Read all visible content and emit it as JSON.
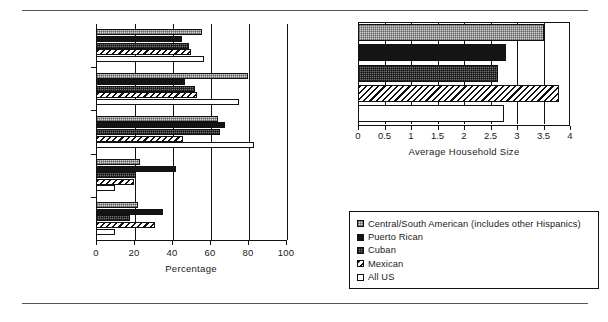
{
  "chart_data": [
    {
      "type": "bar",
      "orientation": "horizontal",
      "title": "",
      "xlabel": "Percentage",
      "ylabel": "",
      "xlim": [
        0,
        100
      ],
      "xticks": [
        0,
        20,
        40,
        60,
        80,
        100
      ],
      "xticklabels": [
        "0",
        "20",
        "40",
        "60",
        "80",
        "100"
      ],
      "grid": true,
      "legend_position": "below-right",
      "categories": [
        "Female Labor\nForce",
        "Male Labor Force",
        "High School\nGraduate",
        "Female Head of\nHousehold",
        "Family Poverty"
      ],
      "series": [
        {
          "name": "Central/South American (includes other Hispanics)",
          "values": [
            56,
            80,
            64,
            23,
            22
          ]
        },
        {
          "name": "Puerto Rican",
          "values": [
            45,
            47,
            68,
            42,
            35
          ]
        },
        {
          "name": "Cuban",
          "values": [
            49,
            52,
            65,
            21,
            18
          ]
        },
        {
          "name": "Mexican",
          "values": [
            50,
            53,
            46,
            20,
            31
          ]
        },
        {
          "name": "All US",
          "values": [
            57,
            75,
            83,
            10,
            10
          ]
        }
      ]
    },
    {
      "type": "bar",
      "orientation": "horizontal",
      "title": "",
      "xlabel": "Average Household Size",
      "ylabel": "",
      "xlim": [
        0,
        4
      ],
      "xticks": [
        0,
        0.5,
        1,
        1.5,
        2,
        2.5,
        3,
        3.5,
        4
      ],
      "xticklabels": [
        "0",
        "0.5",
        "1",
        "1.5",
        "2",
        "2.5",
        "3",
        "3.5",
        "4"
      ],
      "grid": true,
      "categories": [
        "Overall"
      ],
      "series": [
        {
          "name": "Central/South American (includes other Hispanics)",
          "values": [
            3.5
          ]
        },
        {
          "name": "Puerto Rican",
          "values": [
            2.8
          ]
        },
        {
          "name": "Cuban",
          "values": [
            2.65
          ]
        },
        {
          "name": "Mexican",
          "values": [
            3.8
          ]
        },
        {
          "name": "All US",
          "values": [
            2.75
          ]
        }
      ]
    }
  ],
  "left_chart": {
    "xlabel": "Percentage",
    "xticklabels": [
      "0",
      "20",
      "40",
      "60",
      "80",
      "100"
    ],
    "categories": [
      {
        "line1": "Female Labor",
        "line2": "Force"
      },
      {
        "line1": "Male Labor Force",
        "line2": ""
      },
      {
        "line1": "High School",
        "line2": "Graduate"
      },
      {
        "line1": "Female Head of",
        "line2": "Household"
      },
      {
        "line1": "Family Poverty",
        "line2": ""
      }
    ]
  },
  "right_chart": {
    "xlabel": "Average Household Size",
    "xticklabels": [
      "0",
      "0.5",
      "1",
      "1.5",
      "2",
      "2.5",
      "3",
      "3.5",
      "4"
    ]
  },
  "legend": {
    "items": [
      {
        "label": "Central/South American (includes other Hispanics)",
        "pattern": "checker-light"
      },
      {
        "label": "Puerto Rican",
        "pattern": "solid-black"
      },
      {
        "label": "Cuban",
        "pattern": "checker-dark"
      },
      {
        "label": "Mexican",
        "pattern": "diagonal-hatch"
      },
      {
        "label": "All US",
        "pattern": "white"
      }
    ]
  },
  "colors": {
    "central_south_american": "#d2d2d2",
    "puerto_rican": "#141414",
    "cuban": "#6f6f6f",
    "mexican": "#ffffff",
    "all_us": "#ffffff",
    "axis": "#111111"
  }
}
